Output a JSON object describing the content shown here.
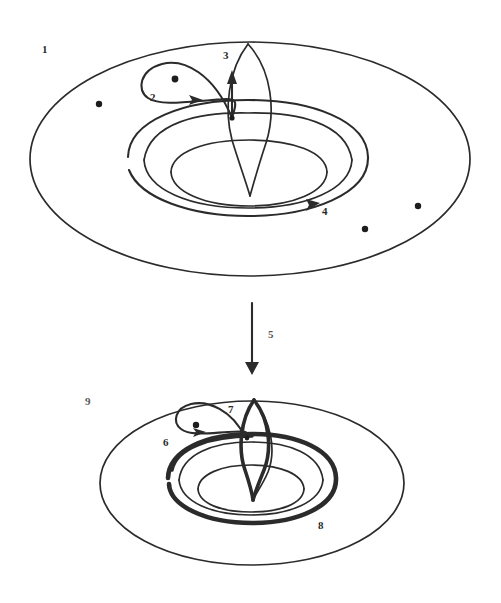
{
  "figure": {
    "background_color": "#ffffff",
    "ink_color": "#2b2b2b",
    "width": 501,
    "height": 603
  },
  "labels": [
    {
      "id": "label-1",
      "text": "1",
      "x": 42,
      "y": 44,
      "faded": false
    },
    {
      "id": "label-2",
      "text": "2",
      "x": 150,
      "y": 92,
      "faded": false
    },
    {
      "id": "label-3",
      "text": "3",
      "x": 223,
      "y": 50,
      "faded": false
    },
    {
      "id": "label-4",
      "text": "4",
      "x": 322,
      "y": 206,
      "faded": false
    },
    {
      "id": "label-5",
      "text": "5",
      "x": 268,
      "y": 329,
      "faded": true
    },
    {
      "id": "label-6",
      "text": "6",
      "x": 163,
      "y": 437,
      "faded": false
    },
    {
      "id": "label-7",
      "text": "7",
      "x": 228,
      "y": 404,
      "faded": false
    },
    {
      "id": "label-8",
      "text": "8",
      "x": 318,
      "y": 520,
      "faded": false
    },
    {
      "id": "label-9",
      "text": "9",
      "x": 85,
      "y": 396,
      "faded": true
    }
  ],
  "top_torus": {
    "name": "upper-torus",
    "outer_ellipse": {
      "cx": 250,
      "cy": 159,
      "rx": 220,
      "ry": 117
    },
    "inner_hole_outer": {
      "cx": 248,
      "cy": 160,
      "rx": 104,
      "ry": 47
    },
    "inner_hole_inner": {
      "cx": 248,
      "cy": 173,
      "rx": 77,
      "ry": 33
    },
    "marked_points": [
      {
        "x": 99,
        "y": 104
      },
      {
        "x": 365,
        "y": 229
      },
      {
        "x": 418,
        "y": 206
      },
      {
        "x": 175,
        "y": 79
      }
    ]
  },
  "bottom_torus": {
    "name": "lower-torus",
    "outer_ellipse": {
      "cx": 252,
      "cy": 483,
      "rx": 152,
      "ry": 82
    },
    "inner_hole_outer": {
      "cx": 251,
      "cy": 480,
      "rx": 72,
      "ry": 33
    },
    "inner_hole_inner": {
      "cx": 251,
      "cy": 489,
      "rx": 53,
      "ry": 23
    },
    "marked_points": [
      {
        "x": 196,
        "y": 425
      }
    ]
  },
  "transform_arrow": {
    "name": "downward-arrow",
    "from_y": 303,
    "to_y": 373,
    "x": 252
  },
  "curves": {
    "meridian_loop_label": "3",
    "longitude_loop_label": "4",
    "figure_eight_loop_label": "2",
    "lower_meridian_label": "7",
    "lower_longitude_label": "8",
    "lower_figure_eight_label": "6"
  }
}
